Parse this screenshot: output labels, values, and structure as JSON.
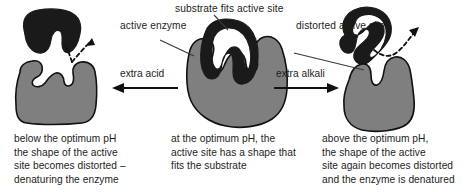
{
  "diagram": {
    "colors": {
      "enzyme_fill": "#7f7f7f",
      "substrate_fill": "#1a1a1a",
      "outline": "#111111",
      "text": "#1d1d1d",
      "background": "#ffffff"
    },
    "labels": {
      "active_enzyme": "active\nenzyme",
      "substrate_fits": "substrate fits active site",
      "distorted_active_site": "distorted\nactive site"
    },
    "arrows": {
      "left_label": "extra acid",
      "left_direction": "left",
      "right_label": "extra alkali",
      "right_direction": "right"
    },
    "panels": [
      {
        "id": "acidic",
        "caption": "below the optimum pH\nthe shape of the active\nsite becomes distorted –\ndenaturing the enzyme",
        "substrate_state": "detached",
        "enzyme_state": "distorted"
      },
      {
        "id": "optimum",
        "caption": "at the optimum pH, the\nactive site has a shape that\nfits the substrate",
        "substrate_state": "bound",
        "enzyme_state": "normal"
      },
      {
        "id": "alkaline",
        "caption": "above the optimum pH,\nthe shape of the active\nsite again becomes distorted\nand the enzyme is denatured",
        "substrate_state": "detached",
        "enzyme_state": "distorted"
      }
    ]
  }
}
